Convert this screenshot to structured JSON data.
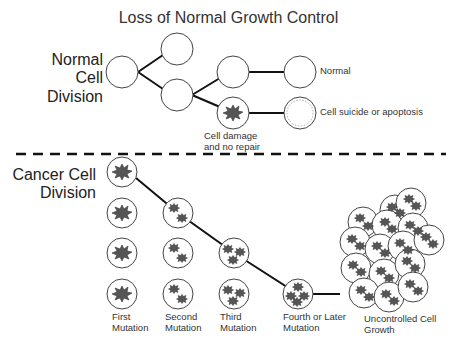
{
  "title": "Loss of Normal Growth Control",
  "normal_section": {
    "label_lines": [
      "Normal",
      "Cell",
      "Division"
    ],
    "outcome_normal": "Normal",
    "outcome_apoptosis": "Cell suicide or apoptosis",
    "damage_label_lines": [
      "Cell damage",
      "and no repair"
    ]
  },
  "cancer_section": {
    "label_lines": [
      "Cancer Cell",
      "Division"
    ],
    "stages": [
      {
        "lines": [
          "First",
          "Mutation"
        ]
      },
      {
        "lines": [
          "Second",
          "Mutation"
        ]
      },
      {
        "lines": [
          "Third",
          "Mutation"
        ]
      },
      {
        "lines": [
          "Fourth or Later",
          "Mutation"
        ]
      }
    ],
    "final_lines": [
      "Uncontrolled Cell",
      "Growth"
    ]
  },
  "colors": {
    "line": "#111111",
    "cell_fill": "#ffffff",
    "cell_stroke": "#444444",
    "damage_fill": "#555555"
  }
}
